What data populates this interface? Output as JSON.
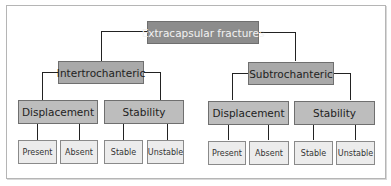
{
  "diagram": {
    "root": {
      "label": "Extracapsular fractures"
    },
    "branches": [
      {
        "label": "Intertrochanteric",
        "groups": [
          {
            "label": "Displacement",
            "leaves": [
              "Present",
              "Absent"
            ]
          },
          {
            "label": "Stability",
            "leaves": [
              "Stable",
              "Unstable"
            ]
          }
        ]
      },
      {
        "label": "Subtrochanteric",
        "groups": [
          {
            "label": "Displacement",
            "leaves": [
              "Present",
              "Absent"
            ]
          },
          {
            "label": "Stability",
            "leaves": [
              "Stable",
              "Unstable"
            ]
          }
        ]
      }
    ]
  },
  "colors": {
    "root_fill": "#8c8c8c",
    "level1_fill": "#a9a9a9",
    "level2_fill": "#bdbdbd",
    "leaf_fill": "#ececec",
    "connector": "#222222"
  }
}
